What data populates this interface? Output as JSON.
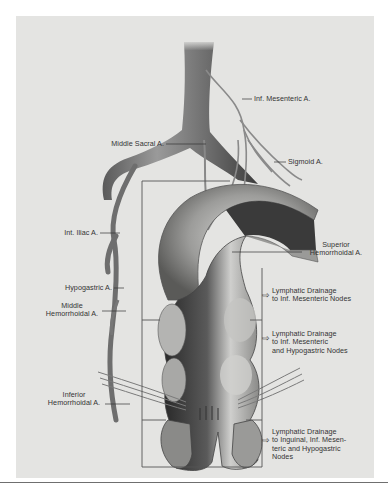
{
  "figure": {
    "type": "anatomical illustration",
    "background_color": "#e4e4e2",
    "ink_color": "#333333"
  },
  "labels": {
    "inf_mesenteric": "Inf. Mesenteric A.",
    "middle_sacral": "Middle Sacral A.",
    "sigmoid": "Sigmoid A.",
    "int_iliac": "Int. Iliac A.",
    "superior_hemorrhoidal_1": "Superior",
    "superior_hemorrhoidal_2": "Hemorrhoidal A.",
    "hypogastric": "Hypogastric A.",
    "middle_hemorrhoidal_1": "Middle",
    "middle_hemorrhoidal_2": "Hemorrhoidal A.",
    "inferior_hemorrhoidal_1": "Inferior",
    "inferior_hemorrhoidal_2": "Hemorrhoidal A."
  },
  "drainage": [
    {
      "lines": [
        "Lymphatic Drainage",
        "to Inf. Mesenteric Nodes"
      ]
    },
    {
      "lines": [
        "Lymphatic Drainage",
        "to Inf. Mesenteric",
        "and Hypogastric Nodes"
      ]
    },
    {
      "lines": [
        "Lymphatic Drainage",
        "to Inguinal, Inf. Mesen-",
        "teric and Hypogastric",
        "Nodes"
      ]
    }
  ],
  "arrow_glyph": "⇨",
  "caption_cutoff": "(caption text below rule is cut off)"
}
